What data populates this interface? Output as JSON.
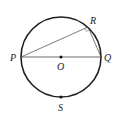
{
  "diagram": {
    "circle": {
      "cx": 61,
      "cy": 57,
      "r": 40,
      "stroke": "#222222"
    },
    "points": {
      "P": {
        "label": "P",
        "x": 21,
        "y": 57
      },
      "Q": {
        "label": "Q",
        "x": 101,
        "y": 57
      },
      "R": {
        "label": "R",
        "x": 88,
        "y": 27
      },
      "O": {
        "label": "O",
        "x": 61,
        "y": 57
      },
      "S": {
        "label": "S",
        "x": 61,
        "y": 97
      }
    },
    "segments": [
      "PQ",
      "PR",
      "RQ"
    ],
    "right_angle_marker_at": "R"
  }
}
